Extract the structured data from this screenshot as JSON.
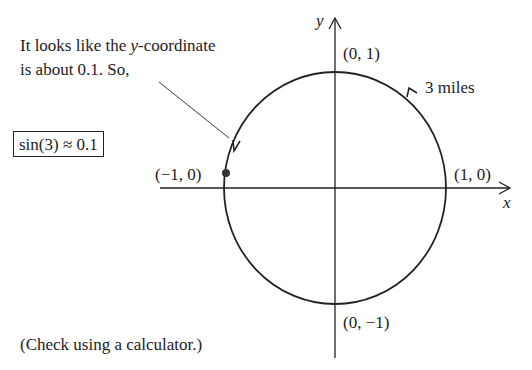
{
  "annotation": {
    "line1_pre": "It looks like the ",
    "line1_var": "y",
    "line1_post": "-coordinate",
    "line2": "is about 0.1. So,"
  },
  "result_box": "sin(3) ≈ 0.1",
  "footnote": "(Check using a calculator.)",
  "axes": {
    "x_label": "x",
    "y_label": "y"
  },
  "points": {
    "top": "(0, 1)",
    "right": "(1, 0)",
    "left": "(−1, 0)",
    "bottom": "(0, −1)"
  },
  "arc_label": "3 miles",
  "colors": {
    "ink": "#222222",
    "background": "#ffffff"
  }
}
